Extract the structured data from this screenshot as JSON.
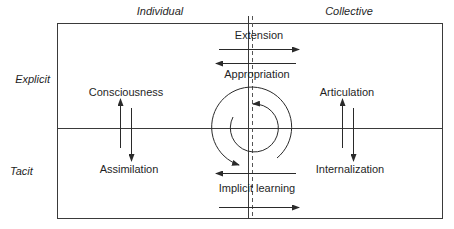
{
  "diagram": {
    "column_headers": [
      {
        "label": "Individual"
      },
      {
        "label": "Collective"
      }
    ],
    "row_headers": [
      {
        "label": "Explicit"
      },
      {
        "label": "Tacit"
      }
    ],
    "quadrant_labels": {
      "top_left": "Consciousness",
      "bottom_left": "Assimilation",
      "top_right": "Articulation",
      "bottom_right": "Internalization"
    },
    "flow_labels": {
      "top_outbound": "Extension",
      "top_inbound": "Appropriation",
      "bottom": "Implicit learning"
    },
    "cycle": {
      "description": "Two concentric circular arrows in the center indicating a continuous cycle"
    },
    "colors": {
      "line": "#2a2a2a",
      "text": "#1f1f1f",
      "background": "#ffffff"
    }
  }
}
